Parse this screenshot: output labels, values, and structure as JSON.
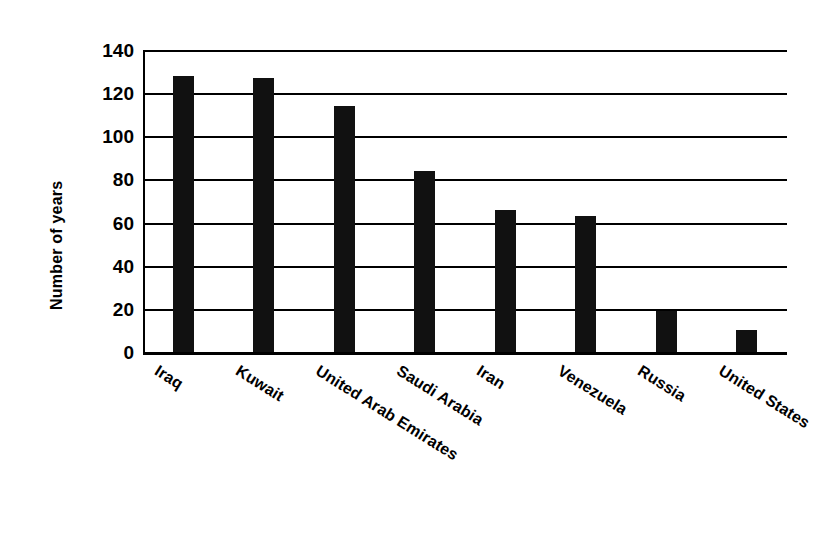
{
  "chart_data": {
    "type": "bar",
    "title": "",
    "subtitle": "",
    "xlabel": "",
    "ylabel": "Number of years",
    "categories": [
      "Iraq",
      "Kuwait",
      "United Arab Emirates",
      "Saudi Arabia",
      "Iran",
      "Venezuela",
      "Russia",
      "United States"
    ],
    "values": [
      128,
      127,
      114,
      84,
      66,
      63,
      19,
      10
    ],
    "ylim": [
      0,
      140
    ],
    "yticks": [
      0,
      20,
      40,
      60,
      80,
      100,
      120,
      140
    ],
    "ytick_labels": [
      "0",
      "20",
      "40",
      "60",
      "80",
      "100",
      "120",
      "140"
    ],
    "grid": true,
    "legend": false,
    "bar_color": "#111111",
    "axis_color": "#000000",
    "background_color": "#ffffff",
    "x_label_rotation_deg": 32
  }
}
